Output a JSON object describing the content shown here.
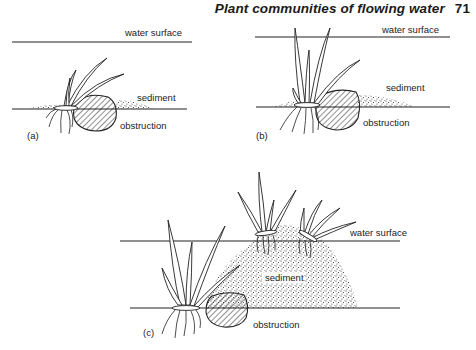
{
  "header": {
    "title": "Plant communities of flowing water",
    "page_number": "71"
  },
  "panels": {
    "a": {
      "label": "(a)",
      "water_surface": "water surface",
      "sediment": "sediment",
      "obstruction": "obstruction"
    },
    "b": {
      "label": "(b)",
      "water_surface": "water surface",
      "sediment": "sediment",
      "obstruction": "obstruction"
    },
    "c": {
      "label": "(c)",
      "water_surface": "water surface",
      "sediment": "sediment",
      "obstruction": "obstruction"
    }
  }
}
